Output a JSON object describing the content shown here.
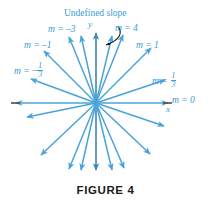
{
  "figure": {
    "caption": "FIGURE 4",
    "caption_top": 184,
    "headline": {
      "text": "Undefined slope",
      "left": 64,
      "top": 9
    },
    "axis_labels": [
      {
        "name": "y-axis-label",
        "text": "y",
        "left": 88,
        "top": 20
      },
      {
        "name": "x-axis-label",
        "text": "x",
        "left": 166,
        "top": 105
      }
    ],
    "slope_labels": [
      {
        "name": "slope-label-neg-3",
        "text_prefix": "m = ",
        "value": "–3",
        "left": 48,
        "top": 25,
        "fraction": null
      },
      {
        "name": "slope-label-4",
        "text_prefix": "m = ",
        "value": "4",
        "left": 115,
        "top": 24,
        "fraction": null
      },
      {
        "name": "slope-label-neg-1",
        "text_prefix": "m = ",
        "value": "–1",
        "left": 24,
        "top": 41,
        "fraction": null
      },
      {
        "name": "slope-label-1",
        "text_prefix": "m = ",
        "value": "1",
        "left": 136,
        "top": 41,
        "fraction": null
      },
      {
        "name": "slope-label-neg-one-third",
        "text_prefix": "m = ",
        "value": "–",
        "left": 14,
        "top": 62,
        "fraction": {
          "num": "1",
          "den": "3"
        }
      },
      {
        "name": "slope-label-one-third",
        "text_prefix": "m = ",
        "value": "",
        "left": 152,
        "top": 72,
        "fraction": {
          "num": "1",
          "den": "3"
        }
      },
      {
        "name": "slope-label-0",
        "text_prefix": "m = ",
        "value": "0",
        "left": 172,
        "top": 96,
        "fraction": null
      }
    ],
    "colors": {
      "ray": "#4aa3d8",
      "ray_light": "#7ec2e6",
      "axis": "#3d86b8",
      "label_text": "#3a9ad4",
      "caption_text": "#1a1a1a",
      "pointer_arrow": "#141414",
      "background": "#ffffff"
    }
  },
  "chart_data": {
    "type": "scatter",
    "title": "Undefined slope",
    "subtitle": "FIGURE 4",
    "xlabel": "x",
    "ylabel": "y",
    "origin": {
      "x": 96,
      "y": 103
    },
    "labeled_slopes": [
      {
        "label": "m = –3",
        "value": -3,
        "angle_deg": 108
      },
      {
        "label": "m = 4",
        "value": 4,
        "angle_deg": 76
      },
      {
        "label": "m = –1",
        "value": -1,
        "angle_deg": 135
      },
      {
        "label": "m = 1",
        "value": 1,
        "angle_deg": 45
      },
      {
        "label": "m = –1/3",
        "value": -0.333333,
        "angle_deg": 162
      },
      {
        "label": "m = 1/3",
        "value": 0.333333,
        "angle_deg": 18
      },
      {
        "label": "m = 0",
        "value": 0,
        "angle_deg": 0
      },
      {
        "label": "Undefined slope",
        "value": null,
        "angle_deg": 90
      }
    ],
    "rays_angles_deg": [
      0,
      18,
      45,
      76,
      90,
      108,
      135,
      162,
      180,
      198,
      225,
      256,
      270,
      288,
      315,
      342
    ],
    "grid": false,
    "legend": "none"
  }
}
